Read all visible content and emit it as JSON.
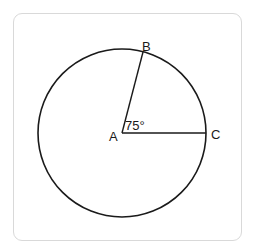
{
  "diagram": {
    "title": "",
    "shape": "circle",
    "colors": {
      "stroke": "#1a1a1a",
      "frame": "#d9d9d9",
      "background": "#ffffff"
    },
    "circle": {
      "cx": 122,
      "cy": 133,
      "r": 84
    },
    "points": {
      "A": {
        "label": "A",
        "x": 122,
        "y": 133
      },
      "B": {
        "label": "B",
        "x": 143,
        "y": 52
      },
      "C": {
        "label": "C",
        "x": 206,
        "y": 133
      }
    },
    "segments": [
      [
        "A",
        "B"
      ],
      [
        "A",
        "C"
      ]
    ],
    "angle": {
      "vertex": "A",
      "label": "75°",
      "degrees": 75
    }
  }
}
